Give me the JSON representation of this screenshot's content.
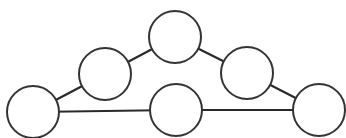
{
  "diagram": {
    "type": "graph",
    "width": 346,
    "height": 138,
    "colors": {
      "stroke": "#333333",
      "fill": "#ffffff",
      "background": "#ffffff"
    },
    "nodes": [
      {
        "id": "n1",
        "label": "",
        "cx": 33,
        "cy": 112,
        "r": 26
      },
      {
        "id": "n2",
        "label": "",
        "cx": 105,
        "cy": 74,
        "r": 26
      },
      {
        "id": "n3",
        "label": "",
        "cx": 175,
        "cy": 37,
        "r": 26
      },
      {
        "id": "n4",
        "label": "",
        "cx": 247,
        "cy": 73,
        "r": 26
      },
      {
        "id": "n5",
        "label": "",
        "cx": 319,
        "cy": 110,
        "r": 26
      },
      {
        "id": "n6",
        "label": "",
        "cx": 176,
        "cy": 110,
        "r": 26
      }
    ],
    "edges": [
      {
        "from": "n1",
        "to": "n2"
      },
      {
        "from": "n2",
        "to": "n3"
      },
      {
        "from": "n3",
        "to": "n4"
      },
      {
        "from": "n4",
        "to": "n5"
      },
      {
        "from": "n1",
        "to": "n6"
      },
      {
        "from": "n6",
        "to": "n5"
      }
    ]
  }
}
